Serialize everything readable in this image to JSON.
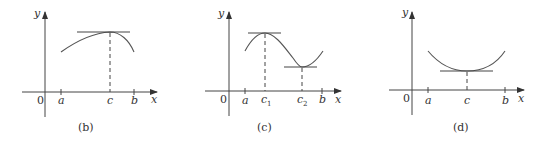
{
  "figure": {
    "panels": [
      {
        "caption": "(b)",
        "axis_labels": {
          "y": "y",
          "x": "x",
          "origin": "0"
        },
        "tick_labels": [
          "a",
          "c",
          "b"
        ],
        "description": "Curve with a local maximum at c; horizontal tangent at peak"
      },
      {
        "caption": "(c)",
        "axis_labels": {
          "y": "y",
          "x": "x",
          "origin": "0"
        },
        "tick_labels": [
          "a",
          "c",
          "1",
          "c",
          "2",
          "b"
        ],
        "description": "Curve with a local maximum at c1 and local minimum at c2; horizontal tangents at both"
      },
      {
        "caption": "(d)",
        "axis_labels": {
          "y": "y",
          "x": "x",
          "origin": "0"
        },
        "tick_labels": [
          "a",
          "c",
          "b"
        ],
        "description": "Curve with a local minimum at c; horizontal tangent at trough"
      }
    ]
  }
}
